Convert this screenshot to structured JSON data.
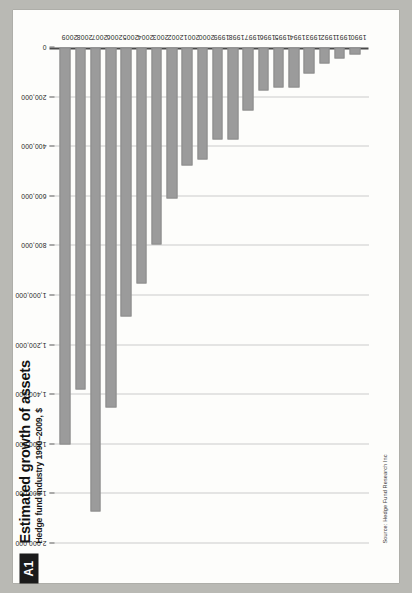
{
  "page": {
    "badge": "A1",
    "title": "Estimated growth of assets",
    "subtitle": "Hedge fund industry 1990–2009, $",
    "source": "Source: Hedge Fund Research Inc",
    "background_color": "#b9b9b4",
    "paper_color": "#fdfdfb",
    "bar_color": "#9b9b9b",
    "badge_color": "#1b1b1b"
  },
  "chart_data": {
    "type": "bar",
    "orientation": "horizontal",
    "title": "Estimated growth of assets",
    "subtitle": "Hedge fund industry 1990–2009, $",
    "xlabel": "",
    "ylabel": "",
    "xlim": [
      0,
      2000000
    ],
    "grid": true,
    "legend": "none",
    "source": "Source: Hedge Fund Research Inc",
    "tick_labels": [
      "2,000,000",
      "1,800,000",
      "1,600,000",
      "1,400,000",
      "1,200,000",
      "1,000,000",
      "800,000",
      "600,000",
      "400,000",
      "200,000",
      "0"
    ],
    "ticks": [
      2000000,
      1800000,
      1600000,
      1400000,
      1200000,
      1000000,
      800000,
      600000,
      400000,
      200000,
      0
    ],
    "categories": [
      "2009",
      "2008",
      "2007",
      "2006",
      "2005",
      "2004",
      "2003",
      "2002",
      "2001",
      "2000",
      "1999",
      "1998",
      "1997",
      "1996",
      "1995",
      "1994",
      "1993",
      "1992",
      "1991",
      "1990"
    ],
    "values": [
      1600000,
      1380000,
      1870000,
      1450000,
      1085000,
      950000,
      795000,
      610000,
      475000,
      450000,
      370000,
      370000,
      255000,
      175000,
      160000,
      160000,
      105000,
      65000,
      45000,
      30000
    ]
  }
}
